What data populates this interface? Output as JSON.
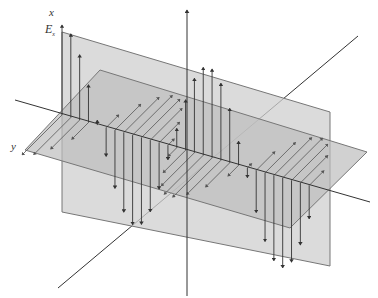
{
  "labels": {
    "x_axis": "x",
    "y_axis": "y",
    "e_field": "E",
    "e_field_sub": "x"
  },
  "colors": {
    "vertical_plane": "#cfcfcf",
    "horizontal_plane": "#bdbdbd",
    "plane_edge": "#777777",
    "axis": "#333333",
    "e_arrow": "#333333",
    "b_arrow": "#555555"
  },
  "geometry": {
    "vertical_plane": [
      [
        62,
        32
      ],
      [
        330,
        112
      ],
      [
        330,
        266
      ],
      [
        62,
        212
      ]
    ],
    "horizontal_plane": [
      [
        25,
        150
      ],
      [
        100,
        70
      ],
      [
        367,
        152
      ],
      [
        290,
        228
      ]
    ],
    "x_axis": {
      "x": 187,
      "y1": 296,
      "y2": 10
    },
    "z_axis": {
      "x1": 15,
      "y1": 100,
      "x2": 370,
      "y2": 202
    },
    "diag_axis": {
      "x1": 58,
      "y1": 288,
      "x2": 358,
      "y2": 36
    }
  },
  "wave": {
    "start": [
      62,
      115
    ],
    "end": [
      318,
      188
    ],
    "samples": 30,
    "cycles": 1.75,
    "e_amplitude": 90,
    "b_amplitude_dx": -40,
    "b_amplitude_dy": 40
  }
}
